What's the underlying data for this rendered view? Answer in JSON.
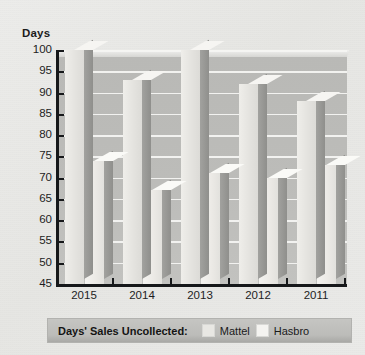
{
  "chart_data": {
    "type": "bar",
    "title": "",
    "subtitle": "",
    "xlabel": "",
    "ylabel": "Days",
    "ylim": [
      45,
      100
    ],
    "ytick_step": 5,
    "yticks": [
      100,
      95,
      90,
      85,
      80,
      75,
      70,
      65,
      60,
      55,
      50,
      45
    ],
    "categories": [
      "2015",
      "2014",
      "2013",
      "2012",
      "2011"
    ],
    "grid": true,
    "legend_position": "bottom",
    "series": [
      {
        "name": "Mattel",
        "values": [
          100,
          93,
          100,
          92,
          88
        ],
        "color": "#e8e7e3"
      },
      {
        "name": "Hasbro",
        "values": [
          74,
          67,
          71,
          70,
          73
        ],
        "color": "#f0efec"
      }
    ]
  },
  "axis": {
    "y_title": "Days"
  },
  "legend": {
    "title": "Days' Sales Uncollected:",
    "entries": [
      {
        "label": "Mattel",
        "color": "#e8e7e3"
      },
      {
        "label": "Hasbro",
        "color": "#f4f3f0"
      }
    ]
  },
  "colors": {
    "page_background": "#e9e9e7",
    "plot_background": "#bcbcb9",
    "gridline": "#f4f4f2",
    "axis": "#16181a",
    "legend_background": "#bcbcb9"
  }
}
